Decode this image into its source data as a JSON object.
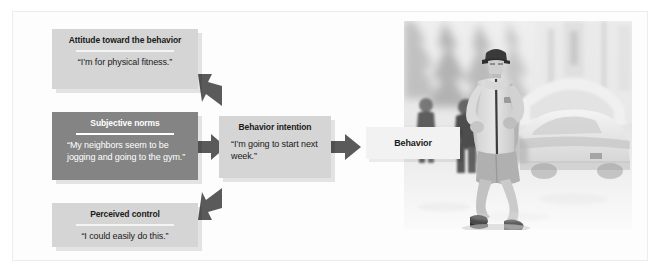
{
  "diagram": {
    "type": "flow-diagram",
    "colors": {
      "box_light_bg": "#d5d5d5",
      "box_dark_bg": "#848484",
      "arrow": "#5a5a5a",
      "text_dark": "#1a1a1a",
      "text_light": "#ffffff",
      "frame_border": "#ededed",
      "label_bg": "#f2f2f2"
    },
    "boxes": {
      "attitude": {
        "title": "Attitude toward the behavior",
        "quote": "“I’m for physical fitness.”",
        "style": "light"
      },
      "norms": {
        "title": "Subjective norms",
        "quote": "“My neighbors seem to be jogging and going to the gym.”",
        "style": "dark"
      },
      "control": {
        "title": "Perceived control",
        "quote": "“I could easily do this.”",
        "style": "light"
      },
      "intention": {
        "title": "Behavior intention",
        "quote": "“I’m going to start next week.”",
        "style": "light"
      },
      "behavior": {
        "title": "Behavior"
      }
    },
    "arrows": {
      "attitude_to_intention": "arrow-down-right",
      "norms_to_intention": "arrow-right",
      "control_to_intention": "arrow-up-right",
      "intention_to_behavior": "arrow-right"
    },
    "photo": {
      "caption": "Jogger running on a snowy street with parked snow-covered cars and pedestrians",
      "name": "jogger-in-snow-photo"
    }
  }
}
